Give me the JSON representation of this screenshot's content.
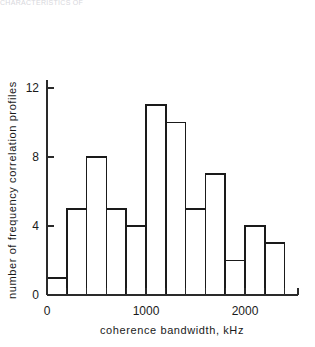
{
  "top_fragment": "CHARACTERISTICS OF",
  "chart_data": {
    "type": "bar",
    "title": "",
    "xlabel": "coherence  bandwidth,  kHz",
    "ylabel": "number of  frequency  correlation  profiles",
    "categories": [
      "0-200",
      "200-400",
      "400-600",
      "600-800",
      "800-1000",
      "1000-1200",
      "1200-1400",
      "1400-1600",
      "1600-1800",
      "1800-2000",
      "2000-2200",
      "2200-2400"
    ],
    "bin_edges": [
      0,
      200,
      400,
      600,
      800,
      1000,
      1200,
      1400,
      1600,
      1800,
      2000,
      2200,
      2400
    ],
    "bin_width": 200,
    "values": [
      1,
      5,
      8,
      5,
      4,
      11,
      10,
      5,
      7,
      2,
      4,
      3
    ],
    "xlim": [
      0,
      2600
    ],
    "ylim": [
      0,
      13
    ],
    "x_ticks": [
      0,
      200,
      400,
      600,
      800,
      1000,
      1200,
      1400,
      1600,
      1800,
      2000,
      2200,
      2400,
      2600
    ],
    "x_tick_labels": [
      {
        "value": 0,
        "label": "0"
      },
      {
        "value": 1000,
        "label": "1000"
      },
      {
        "value": 2000,
        "label": "2000"
      }
    ],
    "y_ticks": [
      0,
      4,
      8,
      12
    ],
    "y_tick_labels": [
      {
        "value": 0,
        "label": "0"
      },
      {
        "value": 4,
        "label": "4"
      },
      {
        "value": 8,
        "label": "8"
      },
      {
        "value": 12,
        "label": "12"
      }
    ],
    "grid": false,
    "legend": null,
    "bar_style": "outline",
    "bar_stroke_color": "#1a1a1a",
    "bar_fill_color": "#ffffff",
    "axis_color": "#2a2a2a",
    "background_color": "#ffffff"
  }
}
